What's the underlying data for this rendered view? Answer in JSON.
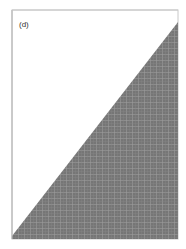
{
  "figure": {
    "panel_label": "(d)",
    "frame": {
      "x": 12,
      "y": 10,
      "width": 166,
      "height": 229,
      "stroke": "#c8c8c8"
    },
    "fill": {
      "color": "#767676",
      "grid_line_color": "#a8a8a8",
      "polygon": [
        [
          12,
          236
        ],
        [
          178,
          22
        ],
        [
          178,
          239
        ],
        [
          12,
          239
        ]
      ]
    }
  }
}
